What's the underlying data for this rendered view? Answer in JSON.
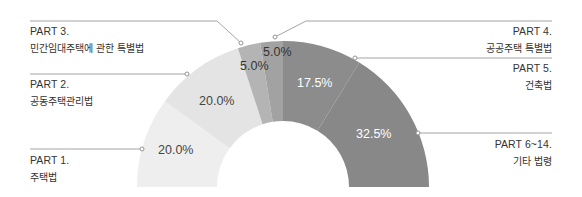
{
  "chart_data": {
    "type": "pie",
    "subtype": "half-donut",
    "title": "",
    "legend_position": "callouts",
    "categories": [
      "PART 1. 주택법",
      "PART 2. 공동주택관리법",
      "PART 3. 민간임대주택에 관한 특별법",
      "PART 4. 공공주택 특별법",
      "PART 5. 건축법",
      "PART 6~14. 기타 법령"
    ],
    "values": [
      20.0,
      20.0,
      5.0,
      5.0,
      17.5,
      32.5
    ],
    "value_labels": [
      "20.0%",
      "20.0%",
      "5.0%",
      "5.0%",
      "17.5%",
      "32.5%"
    ],
    "colors": [
      "#eeeeee",
      "#e4e4e4",
      "#b4b4b4",
      "#a2a2a2",
      "#8c8c8c",
      "#888888"
    ],
    "label_colors": [
      "#444444",
      "#444444",
      "#333333",
      "#333333",
      "#ffffff",
      "#ffffff"
    ]
  },
  "legend": [
    {
      "part": "PART 1.",
      "name": "주택법"
    },
    {
      "part": "PART 2.",
      "name": "공동주택관리법"
    },
    {
      "part": "PART 3.",
      "name": "민간임대주택에 관한 특별법"
    },
    {
      "part": "PART 4.",
      "name": "공공주택 특별법"
    },
    {
      "part": "PART 5.",
      "name": "건축법"
    },
    {
      "part": "PART 6~14.",
      "name": "기타 법령"
    }
  ]
}
